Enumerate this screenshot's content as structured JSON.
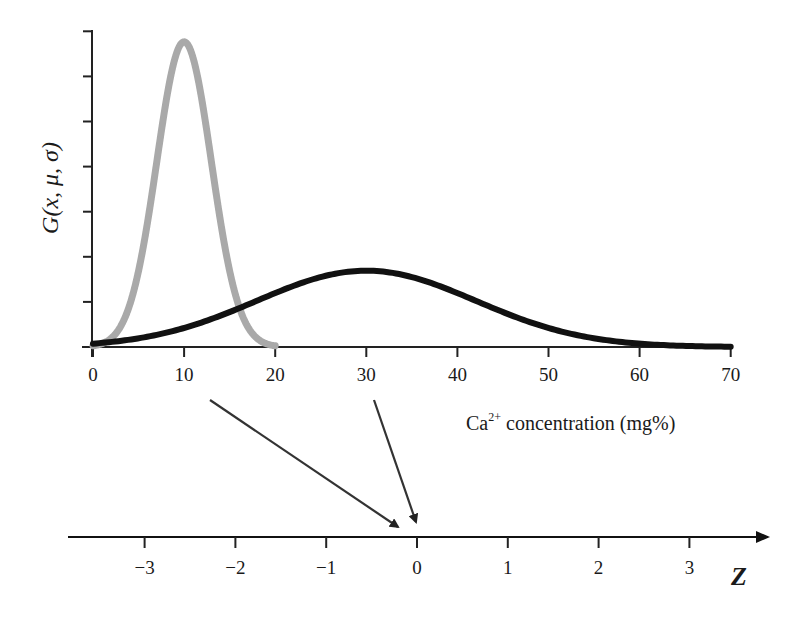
{
  "chart_data": {
    "type": "line",
    "title": "",
    "xlabel": "Ca2+ concentration (mg%)",
    "xlabel_parts": {
      "base": "Ca",
      "sup": "2+",
      "rest": " concentration (mg%)"
    },
    "ylabel": "G(x, μ, σ)",
    "xlim": [
      0,
      70
    ],
    "xticks": [
      0,
      10,
      20,
      30,
      40,
      50,
      60,
      70
    ],
    "yticks_count": 8,
    "ytick_labels": [],
    "grid": false,
    "legend": null,
    "series": [
      {
        "name": "narrow gaussian",
        "mu": 10,
        "sigma": 3,
        "x_range": [
          0,
          20
        ],
        "color": "#a9a9a9",
        "stroke_width": 7,
        "x": [
          0,
          2,
          4,
          6,
          8,
          10,
          12,
          14,
          16,
          18,
          20
        ],
        "values": [
          0.0004,
          0.0038,
          0.018,
          0.0547,
          0.1065,
          0.133,
          0.1065,
          0.0547,
          0.018,
          0.0038,
          0.0004
        ]
      },
      {
        "name": "wide gaussian",
        "mu": 30,
        "sigma": 12,
        "x_range": [
          0,
          70
        ],
        "color": "#111111",
        "stroke_width": 6,
        "x": [
          0,
          10,
          20,
          30,
          40,
          50,
          60,
          70
        ],
        "values": [
          0.0015,
          0.0082,
          0.0236,
          0.0332,
          0.0236,
          0.0082,
          0.0015,
          0.0001
        ]
      }
    ],
    "z_axis": {
      "label": "Z",
      "ticks": [
        -3,
        -2,
        -1,
        0,
        1,
        2,
        3
      ],
      "tick_labels": [
        "−3",
        "−2",
        "−1",
        "0",
        "1",
        "2",
        "3"
      ]
    },
    "annotations": [
      {
        "type": "arrow",
        "from_x": 10,
        "to_z": -0.2,
        "description": "x=10 maps to Z"
      },
      {
        "type": "arrow",
        "from_x": 30,
        "to_z": 0,
        "description": "x=30 (mean) maps to Z=0"
      }
    ]
  },
  "layout": {
    "plot": {
      "x0_px": 93,
      "px_per_unit": 9.11,
      "axis_y": 347,
      "top_y": 30,
      "yaxis_x": 92,
      "ytick_spacing": 45.1
    },
    "zaxis": {
      "z0_px": 417,
      "px_per_unit": 90.8,
      "line_y": 537,
      "start_x": 68,
      "end_x": 768
    },
    "yscale_px_per_unit": 2295
  }
}
